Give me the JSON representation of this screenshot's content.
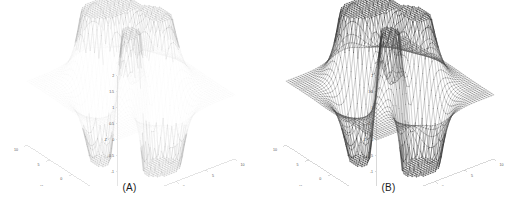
{
  "figure": {
    "background_color": "#ffffff",
    "width": 518,
    "height": 208
  },
  "panels": [
    {
      "id": "A",
      "caption": "(A)",
      "mesh_color": "#d8d8d8",
      "mesh_opacity": 0.22,
      "emphasis_color": "#9a9a9a",
      "axis_color": "#c9c9c9",
      "tick_color": "#9d9d9d"
    },
    {
      "id": "B",
      "caption": "(B)",
      "mesh_color": "#4a4a4a",
      "mesh_opacity": 0.85,
      "emphasis_color": "#2b2b2b",
      "axis_color": "#b4b4b4",
      "tick_color": "#777777"
    }
  ],
  "chart_data": {
    "type": "surface",
    "title": "",
    "subtitle": "",
    "function": "peaks",
    "formula": "z = 3*(1-x)^2*exp(-x^2-(y+1)^2) - 10*(x/5 - x^3 - y^5)*exp(-x^2-y^2) - (1/3)*exp(-(x+1)^2-y^2)",
    "domain_scale": 3.0,
    "grid_n": 49,
    "xlabel": "X",
    "ylabel": "Y",
    "zlabel": "Z",
    "xlim": [
      -10,
      10
    ],
    "ylim": [
      -10,
      10
    ],
    "zlim": [
      -2,
      2
    ],
    "xticks": [
      -10,
      -5,
      0,
      5,
      10
    ],
    "xticklabels": [
      "-10",
      "-5",
      "0",
      "5",
      "10"
    ],
    "yticks": [
      -10,
      -5,
      0,
      5,
      10
    ],
    "yticklabels": [
      "-10",
      "-5",
      "0",
      "5",
      "10"
    ],
    "zticks": [
      -2,
      -1.5,
      -1,
      -0.5,
      0,
      0.5,
      1,
      1.5,
      2
    ],
    "zticklabels": [
      "-2",
      "-1.5",
      "-1",
      "-0.5",
      "0",
      "0.5",
      "1",
      "1.5",
      "2"
    ],
    "grid": false,
    "legend": "none",
    "view_azimuth": -37.5,
    "view_elevation": 30,
    "series": [
      {
        "name": "peaks surface (A)",
        "panel": "A",
        "style": "faint wireframe mesh",
        "zmin": -2,
        "zmax": 2
      },
      {
        "name": "peaks surface (B)",
        "panel": "B",
        "style": "dense dark wireframe mesh",
        "zmin": -2,
        "zmax": 2
      }
    ]
  }
}
